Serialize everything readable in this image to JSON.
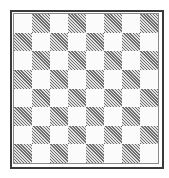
{
  "board": {
    "rows": 8,
    "cols": 8,
    "top_left_color": "light",
    "colors": {
      "light": "#fbfbfb",
      "dark_hatch_line": "#6e6e6e",
      "dark_hatch_bg": "#e2e2e2",
      "border_outer": "#3a3a3a",
      "border_inner": "#8a8a8a"
    },
    "pieces": []
  }
}
